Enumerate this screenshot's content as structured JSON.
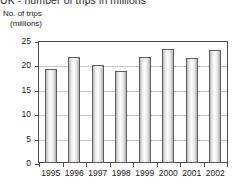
{
  "chart_data": {
    "type": "bar",
    "title": "UK - number of trips in millions",
    "ylabel_line1": "No. of trips",
    "ylabel_line2": "(millions)",
    "xlabel": "",
    "categories": [
      "1995",
      "1996",
      "1997",
      "1998",
      "1999",
      "2000",
      "2001",
      "2002"
    ],
    "values": [
      19.5,
      21.9,
      20.3,
      19.0,
      21.9,
      23.5,
      21.7,
      23.4
    ],
    "yticks": [
      0,
      5,
      10,
      15,
      20,
      25
    ],
    "ytick_labels": [
      "0",
      "5",
      "10",
      "15",
      "20",
      "25"
    ],
    "ylim": [
      0,
      25
    ],
    "grid": "horizontal",
    "legend": "none",
    "series_name": "Number of trips"
  },
  "colors": {
    "axis": "#4a4a4a",
    "grid": "#c9c9c9",
    "bar_outline": "#5d5d5d",
    "bar_fill": "#e9e9e9",
    "text": "#1a1a1a",
    "background": "#ffffff"
  }
}
